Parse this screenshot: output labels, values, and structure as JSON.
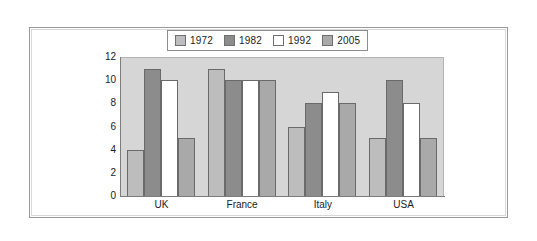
{
  "chart_data": {
    "type": "bar",
    "title": "",
    "subtitle": "",
    "xlabel": "",
    "ylabel": "",
    "categories": [
      "UK",
      "France",
      "Italy",
      "USA"
    ],
    "series": [
      {
        "name": "1972",
        "color": "#bdbdbd",
        "values": [
          4,
          11,
          6,
          5
        ]
      },
      {
        "name": "1982",
        "color": "#8c8c8c",
        "values": [
          11,
          10,
          8,
          10
        ]
      },
      {
        "name": "1992",
        "color": "#ffffff",
        "values": [
          10,
          10,
          9,
          8
        ]
      },
      {
        "name": "2005",
        "color": "#a9a9a9",
        "values": [
          5,
          10,
          8,
          5
        ]
      }
    ],
    "ylim": [
      0,
      12
    ],
    "ytick_labels": [
      "12",
      "10",
      "8",
      "6",
      "4",
      "2",
      "0"
    ],
    "ytick_values": [
      12,
      10,
      8,
      6,
      4,
      2,
      0
    ],
    "grid": false,
    "legend_position": "top-center",
    "plot_background": "#d6d6d6"
  },
  "legend": {
    "items": [
      {
        "label": "1972",
        "color": "#bdbdbd"
      },
      {
        "label": "1982",
        "color": "#8c8c8c"
      },
      {
        "label": "1992",
        "color": "#ffffff"
      },
      {
        "label": "2005",
        "color": "#a9a9a9"
      }
    ]
  }
}
